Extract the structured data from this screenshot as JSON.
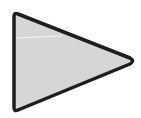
{
  "icon": {
    "name": "play-triangle",
    "fill_color": "#d6d6d6",
    "stroke_color": "#1e1e1e"
  }
}
